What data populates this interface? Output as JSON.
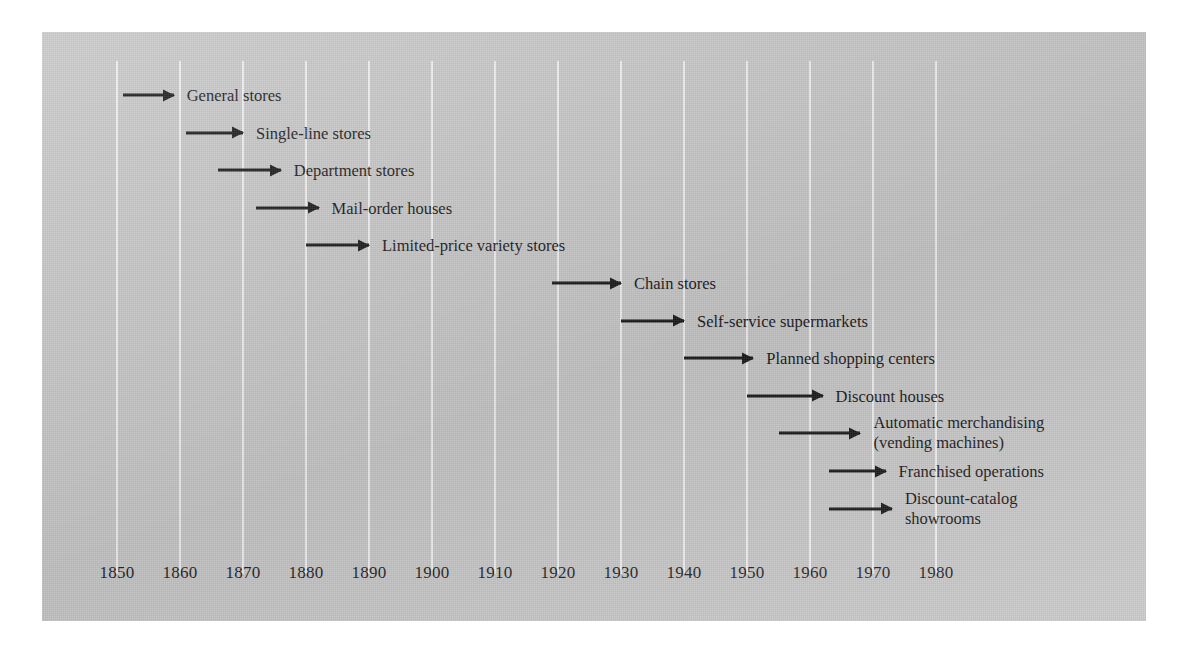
{
  "figure": {
    "background_color": "#c9c9c9",
    "gridline_color": "#f2f2f2",
    "ink_color": "#171717"
  },
  "chart_data": {
    "type": "timeline",
    "title": "",
    "subtitle": "",
    "xlabel": "",
    "ylabel": "",
    "xlim": [
      1845,
      1988
    ],
    "grid": true,
    "legend": false,
    "axis": {
      "tick_labels": [
        "1850",
        "1860",
        "1870",
        "1880",
        "1890",
        "1900",
        "1910",
        "1920",
        "1930",
        "1940",
        "1950",
        "1960",
        "1970",
        "1980"
      ],
      "tick_values": [
        1850,
        1860,
        1870,
        1880,
        1890,
        1900,
        1910,
        1920,
        1930,
        1940,
        1950,
        1960,
        1970,
        1980
      ]
    },
    "categories": [
      "General stores",
      "Single-line stores",
      "Department stores",
      "Mail-order houses",
      "Limited-price variety stores",
      "Chain stores",
      "Self-service supermarkets",
      "Planned shopping centers",
      "Discount houses",
      "Automatic merchandising (vending machines)",
      "Franchised operations",
      "Discount-catalog showrooms"
    ],
    "entries": [
      {
        "label": "General stores",
        "label_line1": "General stores",
        "label_line2": "",
        "start_year": 1851,
        "end_year": 1859
      },
      {
        "label": "Single-line stores",
        "label_line1": "Single-line stores",
        "label_line2": "",
        "start_year": 1861,
        "end_year": 1870
      },
      {
        "label": "Department stores",
        "label_line1": "Department stores",
        "label_line2": "",
        "start_year": 1866,
        "end_year": 1876
      },
      {
        "label": "Mail-order houses",
        "label_line1": "Mail-order houses",
        "label_line2": "",
        "start_year": 1872,
        "end_year": 1882
      },
      {
        "label": "Limited-price variety stores",
        "label_line1": "Limited-price variety stores",
        "label_line2": "",
        "start_year": 1880,
        "end_year": 1890
      },
      {
        "label": "Chain stores",
        "label_line1": "Chain stores",
        "label_line2": "",
        "start_year": 1919,
        "end_year": 1930
      },
      {
        "label": "Self-service supermarkets",
        "label_line1": "Self-service supermarkets",
        "label_line2": "",
        "start_year": 1930,
        "end_year": 1940
      },
      {
        "label": "Planned shopping centers",
        "label_line1": "Planned shopping centers",
        "label_line2": "",
        "start_year": 1940,
        "end_year": 1951
      },
      {
        "label": "Discount houses",
        "label_line1": "Discount houses",
        "label_line2": "",
        "start_year": 1950,
        "end_year": 1962
      },
      {
        "label": "Automatic merchandising (vending machines)",
        "label_line1": "Automatic merchandising",
        "label_line2": "(vending machines)",
        "start_year": 1955,
        "end_year": 1968
      },
      {
        "label": "Franchised operations",
        "label_line1": "Franchised operations",
        "label_line2": "",
        "start_year": 1963,
        "end_year": 1972
      },
      {
        "label": "Discount-catalog showrooms",
        "label_line1": "Discount-catalog",
        "label_line2": "showrooms",
        "start_year": 1963,
        "end_year": 1973
      }
    ]
  }
}
